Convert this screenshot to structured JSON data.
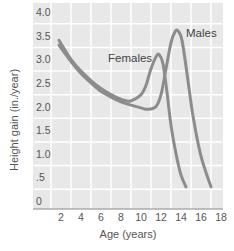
{
  "chart_data": {
    "type": "line",
    "title": "",
    "xlabel": "Age (years)",
    "ylabel": "Height gain (in./year)",
    "xlim": [
      0,
      18
    ],
    "ylim": [
      0,
      4.0
    ],
    "x_ticks": [
      "2",
      "4",
      "6",
      "8",
      "10",
      "12",
      "14",
      "16",
      "18"
    ],
    "y_ticks": [
      "0",
      ".5",
      "1.0",
      "1.5",
      "2.0",
      "2.5",
      "3.0",
      "3.5",
      "4.0"
    ],
    "grid": true,
    "legend_position": "inline labels",
    "series": [
      {
        "name": "Females",
        "x": [
          1.8,
          3,
          4,
          5,
          6,
          7,
          8,
          8.5,
          9,
          10,
          10.5,
          11,
          11.5,
          11.8,
          12.2,
          12.6,
          13,
          13.5,
          14,
          14.5
        ],
        "values": [
          3.4,
          3.0,
          2.75,
          2.55,
          2.38,
          2.25,
          2.15,
          2.12,
          2.12,
          2.25,
          2.45,
          2.8,
          3.05,
          3.1,
          2.9,
          2.3,
          1.6,
          1.0,
          0.55,
          0.3
        ]
      },
      {
        "name": "Males",
        "x": [
          1.8,
          3,
          4,
          5,
          6,
          7,
          8,
          9,
          10,
          10.7,
          11.5,
          12,
          12.5,
          13,
          13.4,
          13.7,
          14.1,
          14.6,
          15.2,
          16,
          17
        ],
        "values": [
          3.3,
          2.95,
          2.7,
          2.5,
          2.32,
          2.2,
          2.1,
          2.03,
          1.97,
          1.94,
          2.0,
          2.25,
          2.8,
          3.35,
          3.58,
          3.6,
          3.4,
          2.7,
          1.8,
          0.95,
          0.3
        ]
      }
    ]
  },
  "labels": {
    "females": "Females",
    "males": "Males",
    "xlabel": "Age (years)",
    "ylabel": "Height gain (in./year)"
  },
  "colors": {
    "plot_bg": "#e8e8e8",
    "grid": "#ffffff",
    "curve": "#8c8c8c",
    "axis": "#888888"
  }
}
